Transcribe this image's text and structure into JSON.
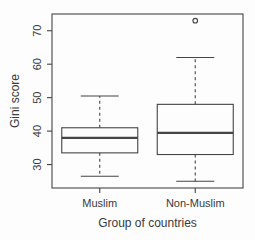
{
  "figure": {
    "background": "#fdfdfd",
    "line_color": "#454545",
    "text_color": "#3a3a3a"
  },
  "chart_data": {
    "type": "boxplot",
    "title": "",
    "xlabel": "Group of countries",
    "ylabel": "Gini score",
    "categories": [
      "Muslim",
      "Non-Muslim"
    ],
    "ylim": [
      23,
      75
    ],
    "yticks": [
      30,
      40,
      50,
      60,
      70
    ],
    "grid": false,
    "legend": "none",
    "series": [
      {
        "name": "Muslim",
        "whisker_low": 26.5,
        "q1": 33.5,
        "median": 38,
        "q3": 41,
        "whisker_high": 50.5,
        "outliers": []
      },
      {
        "name": "Non-Muslim",
        "whisker_low": 25,
        "q1": 33,
        "median": 39.5,
        "q3": 48,
        "whisker_high": 62,
        "outliers": [
          73
        ]
      }
    ]
  }
}
